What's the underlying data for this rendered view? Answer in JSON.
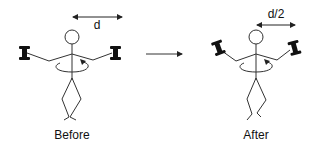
{
  "diagram": {
    "type": "before-after illustration",
    "before": {
      "caption": "Before",
      "distance_label": "d",
      "description": "Stick figure rotating with dumbbells held at arm's length"
    },
    "after": {
      "caption": "After",
      "distance_label": "d/2",
      "description": "Stick figure rotating with dumbbells pulled in to half the distance"
    },
    "transition_arrow": "right-arrow",
    "colors": {
      "stroke": "#333333",
      "dumbbell": "#111111",
      "background": "#ffffff"
    }
  }
}
